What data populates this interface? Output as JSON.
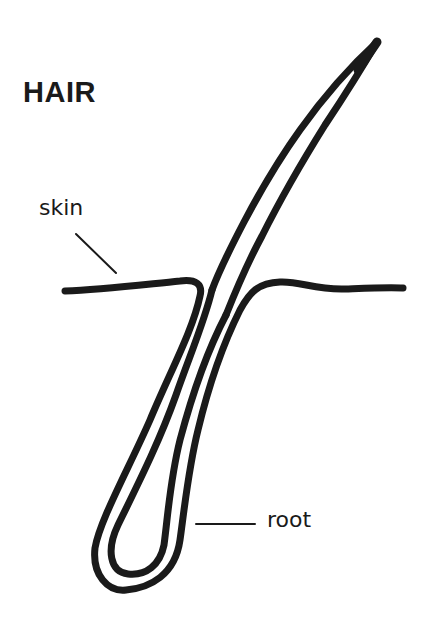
{
  "diagram": {
    "title": "HAIR",
    "labels": {
      "skin": "skin",
      "root": "root"
    },
    "parts": [
      {
        "id": "hair-shaft",
        "name": "hair shaft"
      },
      {
        "id": "skin-surface",
        "name": "skin"
      },
      {
        "id": "hair-root",
        "name": "root"
      }
    ],
    "colors": {
      "ink": "#1a1a1a",
      "background": "#ffffff"
    }
  }
}
